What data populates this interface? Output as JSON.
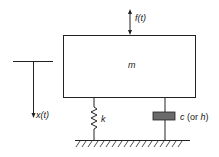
{
  "diagram": {
    "type": "single-degree-of-freedom mass-spring-damper system",
    "labels": {
      "force": "f(t)",
      "mass": "m",
      "displacement": "x(t)",
      "spring": "k",
      "damper_symbol": "c",
      "damper_alt": "(or h)"
    },
    "colors": {
      "line": "#222222",
      "damper_fill": "#6a6a6a",
      "background": "#ffffff"
    }
  }
}
